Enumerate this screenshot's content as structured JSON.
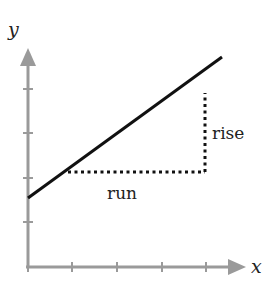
{
  "diagram": {
    "x_axis": {
      "label": "x",
      "ticks": 4,
      "color": "#999999"
    },
    "y_axis": {
      "label": "y",
      "ticks": 4,
      "color": "#999999"
    },
    "line": {
      "color": "#111111"
    },
    "labels": {
      "rise": "rise",
      "run": "run"
    },
    "dotted_color": "#111111"
  }
}
